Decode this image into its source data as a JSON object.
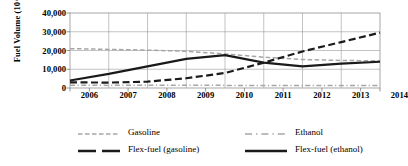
{
  "chart_data": {
    "type": "line",
    "title": "",
    "xlabel": "",
    "ylabel": "Fuel Volume (10^3 m3)",
    "x": [
      2006,
      2007,
      2008,
      2009,
      2010,
      2011,
      2012,
      2013,
      2014
    ],
    "categories": [
      "2006",
      "2007",
      "2008",
      "2009",
      "2010",
      "2011",
      "2012",
      "2013",
      "2014"
    ],
    "xlim": [
      2006,
      2014
    ],
    "ylim": [
      0,
      40000
    ],
    "yticks": [
      0,
      10000,
      20000,
      30000,
      40000
    ],
    "ytick_labels": [
      "0",
      "10,000",
      "20,000",
      "30,000",
      "40,000"
    ],
    "grid": true,
    "legend_position": "bottom",
    "series": [
      {
        "name": "Gasoline",
        "style": "dashed",
        "color": "#a6a6a6",
        "values": [
          21000,
          20600,
          20200,
          19600,
          18200,
          16400,
          15200,
          14700,
          14500
        ]
      },
      {
        "name": "Ethanol",
        "style": "dash-dot",
        "color": "#a6a6a6",
        "values": [
          1500,
          1400,
          1500,
          1500,
          1400,
          1300,
          1300,
          1300,
          1400
        ]
      },
      {
        "name": "Flex-fuel (gasoline)",
        "style": "dashed",
        "color": "#1a1a1a",
        "values": [
          3000,
          2900,
          3400,
          5200,
          8000,
          13500,
          19500,
          24500,
          29500
        ]
      },
      {
        "name": "Flex-fuel (ethanol)",
        "style": "solid",
        "color": "#1a1a1a",
        "values": [
          4000,
          7500,
          11500,
          15500,
          17500,
          13500,
          11500,
          13000,
          14000
        ]
      }
    ]
  },
  "legend": {
    "items": [
      {
        "label": "Gasoline"
      },
      {
        "label": "Ethanol"
      },
      {
        "label": "Flex-fuel (gasoline)"
      },
      {
        "label": "Flex-fuel (ethanol)"
      }
    ]
  }
}
